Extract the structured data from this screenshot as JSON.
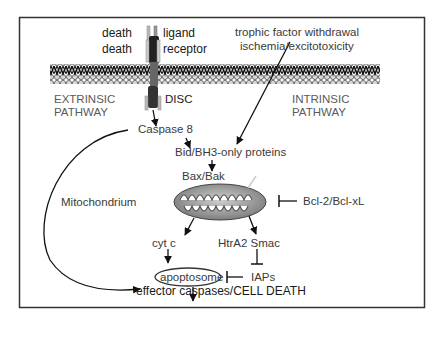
{
  "diagram": {
    "frame": {
      "border_color": "#333333"
    },
    "receptor": {
      "ligand_label_prefix": "death",
      "ligand_label": "ligand",
      "receptor_label_prefix": "death",
      "receptor_label": "receptor",
      "disc_label": "DISC"
    },
    "pathways": {
      "extrinsic": [
        "EXTRINSIC",
        "PATHWAY"
      ],
      "intrinsic": [
        "INTRINSIC",
        "PATHWAY"
      ]
    },
    "stimuli": [
      "trophic factor withdrawal",
      "ischemia/excitotoxicity"
    ],
    "nodes": {
      "caspase8": "Caspase 8",
      "bid": "Bid/BH3-only proteins",
      "bax": "Bax/Bak",
      "mitochondrion": "Mitochondrium",
      "bcl2": "Bcl-2/Bcl-xL",
      "cytc": "cyt c",
      "htra2": "HtrA2 Smac",
      "apoptosome": "apoptosome",
      "iaps": "IAPs",
      "effector": "effector caspases/CELL DEATH"
    },
    "edges": [
      {
        "from": "DISC",
        "to": "Caspase 8",
        "type": "activates"
      },
      {
        "from": "Caspase 8",
        "to": "Bid/BH3-only proteins",
        "type": "activates"
      },
      {
        "from": "trophic factor withdrawal / ischemia",
        "to": "Bid/BH3-only proteins",
        "type": "activates"
      },
      {
        "from": "Bid/BH3-only proteins",
        "to": "Bax/Bak",
        "type": "activates"
      },
      {
        "from": "Bax/Bak",
        "to": "Mitochondrium",
        "type": "activates"
      },
      {
        "from": "Bcl-2/Bcl-xL",
        "to": "Mitochondrium",
        "type": "inhibits"
      },
      {
        "from": "Mitochondrium",
        "to": "cyt c",
        "type": "releases"
      },
      {
        "from": "Mitochondrium",
        "to": "HtrA2 Smac",
        "type": "releases"
      },
      {
        "from": "cyt c",
        "to": "apoptosome",
        "type": "activates"
      },
      {
        "from": "HtrA2 Smac",
        "to": "IAPs",
        "type": "inhibits"
      },
      {
        "from": "IAPs",
        "to": "apoptosome",
        "type": "inhibits"
      },
      {
        "from": "apoptosome",
        "to": "effector caspases/CELL DEATH",
        "type": "activates"
      },
      {
        "from": "Caspase 8",
        "to": "effector caspases/CELL DEATH",
        "type": "activates"
      }
    ]
  }
}
